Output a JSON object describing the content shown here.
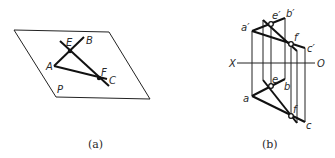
{
  "figure_a": {
    "caption": "(a)",
    "plane_label": "P",
    "points": {
      "A": "A",
      "B": "B",
      "C": "C",
      "E": "E",
      "F": "F"
    },
    "plane": [
      [
        14,
        30
      ],
      [
        109,
        32
      ],
      [
        150,
        99
      ],
      [
        56,
        97
      ]
    ],
    "segments": {
      "AB": [
        [
          54,
          66
        ],
        [
          84,
          37
        ]
      ],
      "AC": [
        [
          54,
          66
        ],
        [
          107,
          79
        ]
      ],
      "line_EF": [
        [
          60,
          41
        ],
        [
          109,
          86
        ]
      ]
    },
    "intersections": {
      "E": [
        70,
        51
      ],
      "F": [
        99,
        78
      ]
    }
  },
  "figure_b": {
    "caption": "(b)",
    "axis_labels": {
      "X": "X",
      "O": "O"
    },
    "points": {
      "a_prime": "a′",
      "b_prime": "b′",
      "c_prime": "c′",
      "e_prime": "e′",
      "f_prime": "f′",
      "a": "a",
      "b": "b",
      "c": "c",
      "e": "e",
      "f": "f"
    },
    "colors": {
      "line": "#111111",
      "thin": "#222222"
    }
  }
}
